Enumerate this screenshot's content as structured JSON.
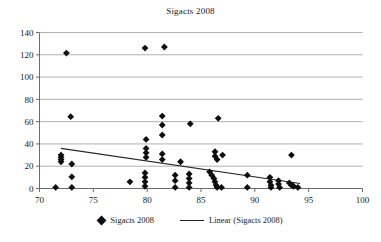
{
  "chart_data": {
    "type": "scatter",
    "title": "Sigacts 2008",
    "xlabel": "",
    "ylabel": "",
    "xlim": [
      70,
      100
    ],
    "ylim": [
      0,
      140
    ],
    "xticks": [
      70,
      75,
      80,
      85,
      90,
      95,
      100
    ],
    "yticks": [
      0,
      20,
      40,
      60,
      80,
      100,
      120,
      140
    ],
    "grid": "horizontal",
    "legend_position": "bottom",
    "legend": [
      {
        "label": "Sigacts 2008",
        "marker": "diamond"
      },
      {
        "label": "Linear (Sigacts 2008)",
        "marker": "line"
      }
    ],
    "series": [
      {
        "name": "Sigacts 2008",
        "marker": "diamond",
        "color": "#0d0d0d",
        "points": [
          [
            72.5,
            121.5
          ],
          [
            79.8,
            126.0
          ],
          [
            81.6,
            127.0
          ],
          [
            72.9,
            64.5
          ],
          [
            81.4,
            65.0
          ],
          [
            81.4,
            57.0
          ],
          [
            81.4,
            48.0
          ],
          [
            84.0,
            58.0
          ],
          [
            86.6,
            63.0
          ],
          [
            93.4,
            30.0
          ],
          [
            79.9,
            44.0
          ],
          [
            79.9,
            36.0
          ],
          [
            79.9,
            32.0
          ],
          [
            79.9,
            28.0
          ],
          [
            81.4,
            31.0
          ],
          [
            81.4,
            26.0
          ],
          [
            83.1,
            24.0
          ],
          [
            86.3,
            33.0
          ],
          [
            86.3,
            29.0
          ],
          [
            86.5,
            26.0
          ],
          [
            87.0,
            30.0
          ],
          [
            72.0,
            30.0
          ],
          [
            72.0,
            28.0
          ],
          [
            72.0,
            26.0
          ],
          [
            72.0,
            24.0
          ],
          [
            73.0,
            22.0
          ],
          [
            73.0,
            10.5
          ],
          [
            73.0,
            1.0
          ],
          [
            71.5,
            1.0
          ],
          [
            78.4,
            6.0
          ],
          [
            79.8,
            14.0
          ],
          [
            79.8,
            10.0
          ],
          [
            79.8,
            6.0
          ],
          [
            79.8,
            2.0
          ],
          [
            82.6,
            12.0
          ],
          [
            82.6,
            7.0
          ],
          [
            82.6,
            1.0
          ],
          [
            83.9,
            13.0
          ],
          [
            83.9,
            9.0
          ],
          [
            83.9,
            5.0
          ],
          [
            83.9,
            1.0
          ],
          [
            85.8,
            15.0
          ],
          [
            86.0,
            12.0
          ],
          [
            86.2,
            9.0
          ],
          [
            86.3,
            6.0
          ],
          [
            86.4,
            3.0
          ],
          [
            86.5,
            1.0
          ],
          [
            86.9,
            1.0
          ],
          [
            89.3,
            12.0
          ],
          [
            89.3,
            1.0
          ],
          [
            91.4,
            10.0
          ],
          [
            91.4,
            6.0
          ],
          [
            91.5,
            3.0
          ],
          [
            91.5,
            1.0
          ],
          [
            92.2,
            7.0
          ],
          [
            92.2,
            4.0
          ],
          [
            92.3,
            1.0
          ],
          [
            93.2,
            5.0
          ],
          [
            93.4,
            3.0
          ],
          [
            93.6,
            2.0
          ],
          [
            94.0,
            1.0
          ]
        ]
      }
    ],
    "trendline": {
      "name": "Linear (Sigacts 2008)",
      "color": "#262626",
      "x_start": 72.0,
      "y_start": 36.0,
      "x_end": 94.2,
      "y_end": 4.5
    }
  }
}
